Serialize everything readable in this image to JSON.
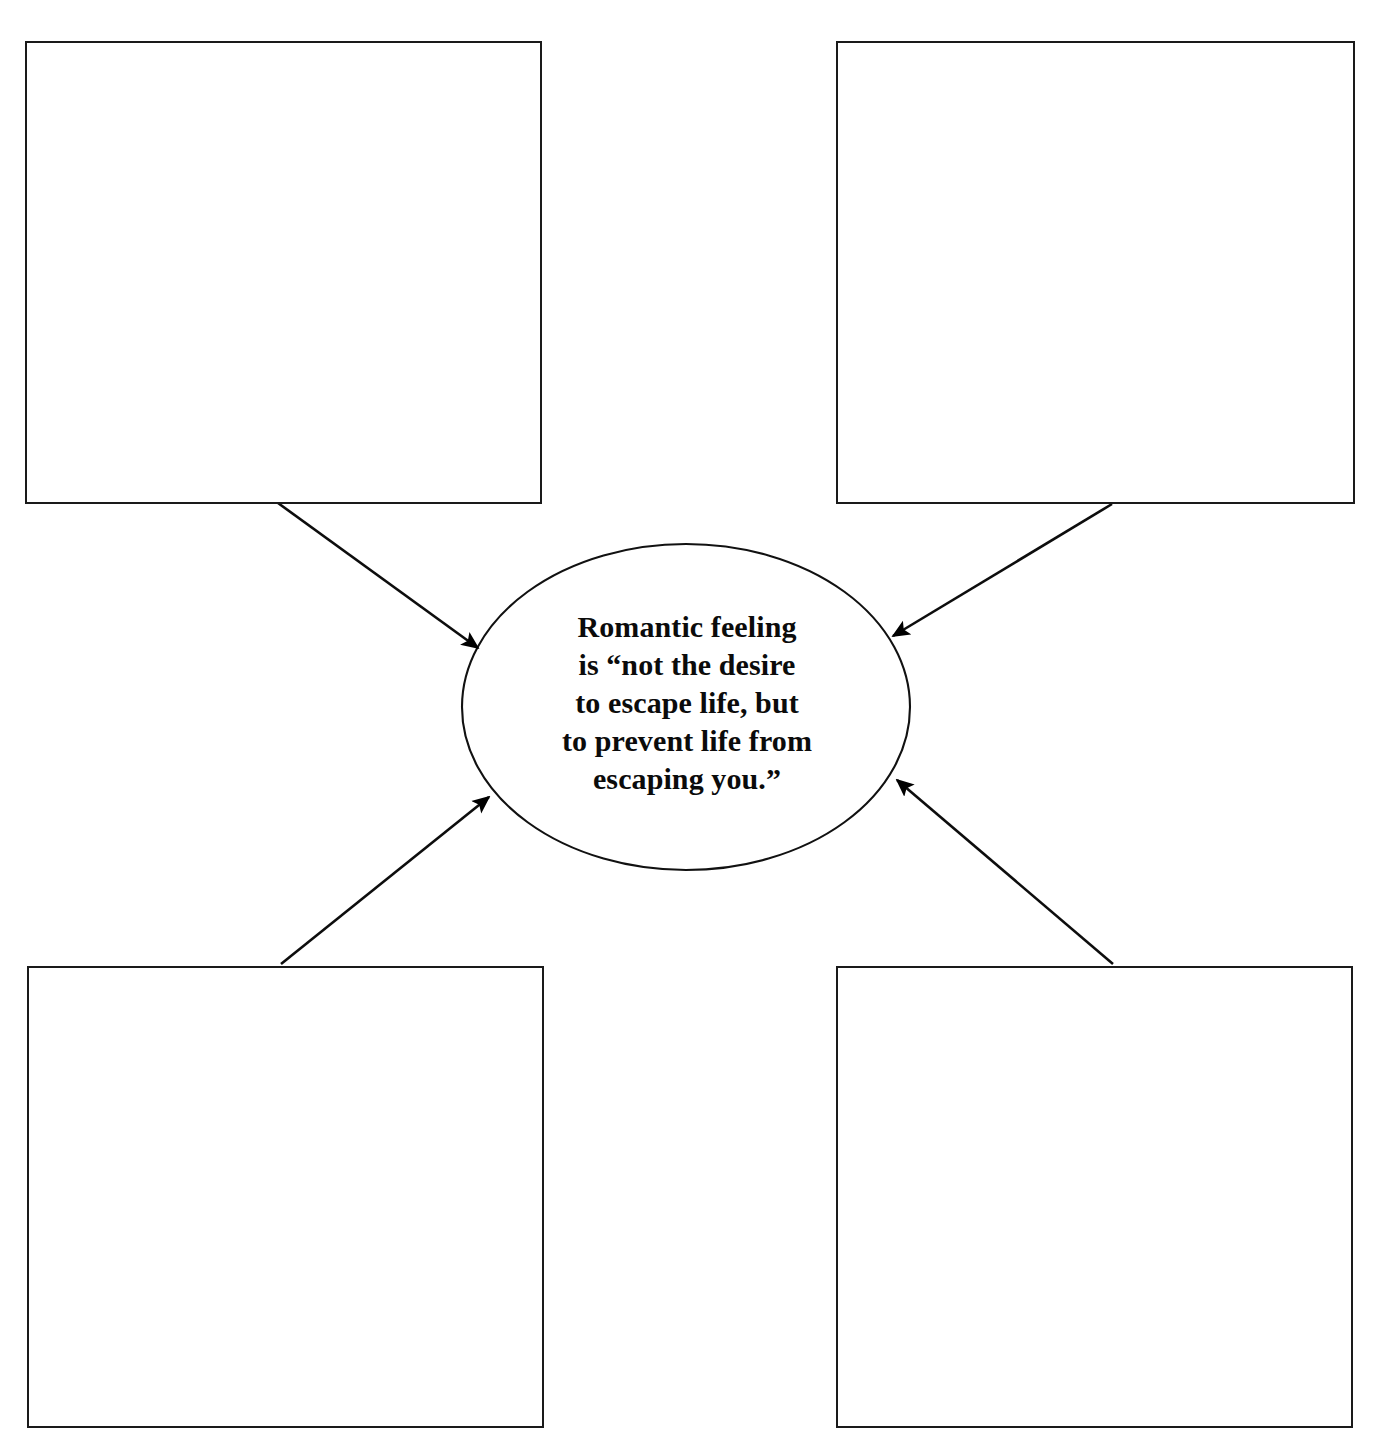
{
  "page": {
    "background_color": "#ffffff",
    "ink_color": "#000000",
    "width": 1384,
    "height": 1449,
    "type": "concept-map-graphic-organizer"
  },
  "center": {
    "shape": "ellipse",
    "quote_text": "Romantic feeling\nis “not the desire\nto escape life, but\nto prevent life from\nescaping you.”",
    "lines": [
      "Romantic feeling",
      "is “not the desire",
      "to escape life, but",
      "to prevent life from",
      "escaping you.”"
    ],
    "cx": 686,
    "cy": 707,
    "rx": 224,
    "ry": 163,
    "stroke_color": "#111111",
    "fill_color": "#ffffff"
  },
  "boxes": [
    {
      "id": "top-left",
      "label": "",
      "x": 25,
      "y": 41,
      "width": 517,
      "height": 463
    },
    {
      "id": "top-right",
      "label": "",
      "x": 836,
      "y": 41,
      "width": 519,
      "height": 463
    },
    {
      "id": "bottom-left",
      "label": "",
      "x": 27,
      "y": 966,
      "width": 517,
      "height": 462
    },
    {
      "id": "bottom-right",
      "label": "",
      "x": 836,
      "y": 966,
      "width": 517,
      "height": 462
    }
  ],
  "arrows": [
    {
      "id": "arrow-top-left-to-center",
      "from": "top-left",
      "to": "center",
      "x1": 278,
      "y1": 503,
      "x2": 478,
      "y2": 648
    },
    {
      "id": "arrow-top-right-to-center",
      "from": "top-right",
      "to": "center",
      "x1": 1112,
      "y1": 504,
      "x2": 893,
      "y2": 636
    },
    {
      "id": "arrow-bottom-left-to-center",
      "from": "bottom-left",
      "to": "center",
      "x1": 281,
      "y1": 964,
      "x2": 489,
      "y2": 797
    },
    {
      "id": "arrow-bottom-right-to-center",
      "from": "bottom-right",
      "to": "center",
      "x1": 1113,
      "y1": 964,
      "x2": 897,
      "y2": 780
    }
  ]
}
